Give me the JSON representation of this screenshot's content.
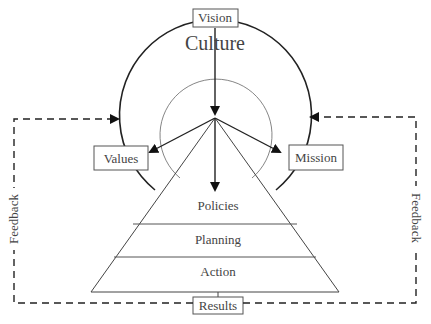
{
  "diagram": {
    "outer_ring_label": "Culture",
    "top_box": "Vision",
    "left_box": "Values",
    "right_box": "Mission",
    "bottom_box": "Results",
    "pyramid_levels": [
      "Policies",
      "Planning",
      "Action"
    ],
    "feedback_left": "Feedback",
    "feedback_right": "Feedback"
  }
}
